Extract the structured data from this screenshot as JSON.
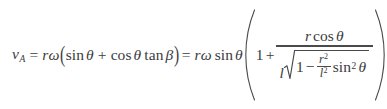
{
  "figure": {
    "kind": "equation",
    "background_color": "#ffffff",
    "text_color": "#3c3c3c",
    "rule_color": "#4a4a4a"
  },
  "equation": {
    "lhs": {
      "variable": "v",
      "subscript": "A"
    },
    "equals_1": "=",
    "term_1": {
      "coefficient_r": "r",
      "coefficient_omega": "ω",
      "open_paren": "(",
      "sin_fn": "sin",
      "theta_1": "θ",
      "plus": "+",
      "cos_fn": "cos",
      "theta_2": "θ",
      "tan_fn": "tan",
      "beta": "β",
      "close_paren": ")"
    },
    "equals_2": "=",
    "term_2": {
      "coefficient_r": "r",
      "coefficient_omega": "ω",
      "sin_fn": "sin",
      "theta": "θ",
      "big_open_paren": "(",
      "one": "1",
      "plus": "+",
      "fraction": {
        "numerator": {
          "r": "r",
          "cos_fn": "cos",
          "theta": "θ"
        },
        "denominator": {
          "l": "l",
          "radical_sign": "√",
          "one": "1",
          "minus": "−",
          "inner_fraction": {
            "numerator_base": "r",
            "numerator_exponent": "2",
            "denominator_base": "l",
            "denominator_exponent": "2"
          },
          "sin_fn": "sin",
          "sin_exponent": "2",
          "theta": "θ"
        }
      },
      "big_close_paren": ")"
    }
  }
}
